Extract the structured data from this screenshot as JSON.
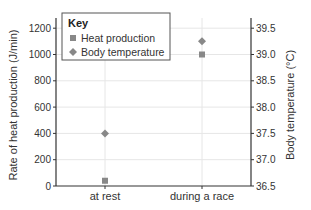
{
  "chart_data": {
    "type": "scatter",
    "title": "",
    "categories": [
      "at rest",
      "during a race"
    ],
    "series": [
      {
        "name": "Heat production",
        "axis": "left",
        "marker": "square",
        "values": [
          40,
          1000
        ]
      },
      {
        "name": "Body temperature",
        "axis": "right",
        "marker": "diamond",
        "values": [
          37.5,
          39.25
        ]
      }
    ],
    "xlabel": "",
    "ylabel": "Rate of heat production (J/min)",
    "ylabel_right": "Body temperature (°C)",
    "ylim": [
      0,
      1300
    ],
    "ylim_right": [
      36.5,
      39.6
    ],
    "yticks": [
      0,
      200,
      400,
      600,
      800,
      1000,
      1200
    ],
    "yticks_right": [
      "36.5",
      "37.0",
      "37.5",
      "38.0",
      "38.5",
      "39.0",
      "39.5"
    ],
    "grid": true,
    "legend": {
      "title": "Key",
      "position": "upper left",
      "entries": [
        "Heat production",
        "Body temperature"
      ]
    }
  },
  "colors": {
    "marker": "#888888",
    "axis": "#333333",
    "grid": "#e6e6e6",
    "text": "#333333"
  }
}
